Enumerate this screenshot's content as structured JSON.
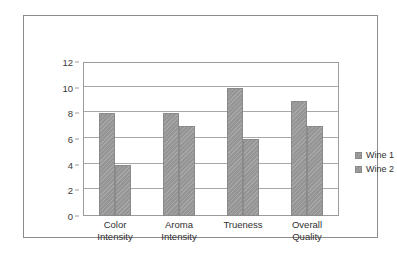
{
  "chart_data": {
    "type": "bar",
    "title": "",
    "xlabel": "",
    "ylabel": "",
    "categories": [
      "Color Intensity",
      "Aroma Intensity",
      "Trueness",
      "Overall Quality"
    ],
    "category_lines": [
      [
        "Color",
        "Intensity"
      ],
      [
        "Aroma",
        "Intensity"
      ],
      [
        "Trueness",
        ""
      ],
      [
        "Overall",
        "Quality"
      ]
    ],
    "series": [
      {
        "name": "Wine 1",
        "values": [
          8,
          8,
          10,
          9
        ],
        "color": "#9a9a9a"
      },
      {
        "name": "Wine 2",
        "values": [
          4,
          7,
          6,
          7
        ],
        "color": "#9a9a9a"
      }
    ],
    "ylim": [
      0,
      12
    ],
    "ytick_values": [
      0,
      2,
      4,
      6,
      8,
      10,
      12
    ],
    "ytick_labels": [
      "0",
      "2",
      "4",
      "6",
      "8",
      "10",
      "12"
    ],
    "grid": true,
    "grid_axis": "y",
    "legend_position": "right",
    "colors": {
      "bar_fill": "#9a9a9a",
      "bar_outline": "#8a8a8a",
      "gridline": "#a8a8a8",
      "plot_border": "#9b9b9b",
      "figure_border": "#8c8c8c",
      "background": "#ffffff",
      "text": "#2f2f2f"
    }
  }
}
